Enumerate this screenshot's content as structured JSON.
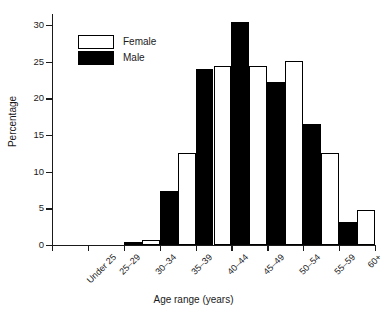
{
  "chart_data": {
    "type": "bar",
    "title": "",
    "xlabel": "Age range (years)",
    "ylabel": "Percentage",
    "categories": [
      "Under 25",
      "25–29",
      "30–34",
      "35–39",
      "40–44",
      "45–49",
      "50–54",
      "55–59",
      "60+"
    ],
    "series": [
      {
        "name": "Male",
        "color": "#000000",
        "values": [
          0,
          0,
          0.4,
          7.4,
          24.0,
          30.4,
          22.2,
          16.5,
          3.2
        ]
      },
      {
        "name": "Female",
        "color": "#ffffff",
        "values": [
          0,
          0,
          0.7,
          12.5,
          24.4,
          24.4,
          25.1,
          12.5,
          4.8
        ]
      }
    ],
    "ylim": [
      0,
      31.5
    ],
    "yticks": [
      0,
      5,
      10,
      15,
      20,
      25,
      30
    ],
    "ytick_labels": [
      "0",
      "5",
      "10",
      "15",
      "20",
      "25",
      "30"
    ],
    "grid": false,
    "legend_position": "upper-left",
    "legend_entries": [
      {
        "label": "Female",
        "swatch": "female"
      },
      {
        "label": "Male",
        "swatch": "male"
      }
    ]
  }
}
